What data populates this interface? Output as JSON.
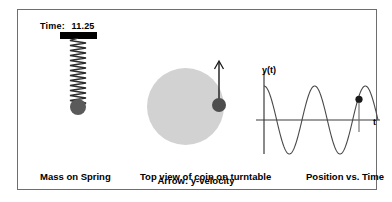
{
  "simulation": {
    "time": {
      "label": "Time:",
      "value": "11.25"
    },
    "spring": {
      "ceiling_name": "spring-support-bar",
      "coil_name": "spring-coil",
      "mass_name": "spring-mass",
      "mass_color": "#5a5a5a",
      "ceiling_color": "#000000"
    },
    "turntable": {
      "disc_color": "#d2d2d2",
      "coin_color": "#4d4d4d",
      "arrow_color": "#000000",
      "arrow_meaning": "y-velocity"
    },
    "graph": {
      "ylabel": "y(t)",
      "xlabel": "t",
      "axis_color": "#3c3c3c",
      "curve_color": "#4a4a4a",
      "marker_color": "#1a1a1a"
    }
  },
  "captions": {
    "spring": "Mass on Spring",
    "turntable": "Top view of coin on turntable",
    "graph": "Position vs. Time",
    "arrow": "Arrow: y-velocity"
  },
  "chart_data": {
    "type": "line",
    "title": "Position vs. Time",
    "xlabel": "t",
    "ylabel": "y(t)",
    "grid": false,
    "legend": "none",
    "xlim": [
      0,
      13.5
    ],
    "ylim": [
      -1.15,
      1.15
    ],
    "series": [
      {
        "name": "y(t)",
        "description": "sinusoidal oscillation, cosine-like, amplitude 1",
        "x": [
          0,
          0.5,
          1,
          1.5,
          2,
          2.5,
          3,
          3.5,
          4,
          4.5,
          5,
          5.5,
          6,
          6.5,
          7,
          7.5,
          8,
          8.5,
          9,
          9.5,
          10,
          10.5,
          11,
          11.25,
          11.5,
          12,
          12.5,
          13
        ],
        "y": [
          1,
          0.87,
          0.5,
          0,
          -0.5,
          -0.87,
          -1,
          -0.87,
          -0.5,
          0,
          0.5,
          0.87,
          1,
          0.87,
          0.5,
          0,
          -0.5,
          -0.87,
          -1,
          -0.87,
          -0.5,
          0,
          0.5,
          0.61,
          0.71,
          0.87,
          1,
          0.87
        ]
      }
    ],
    "markers": [
      {
        "name": "current-position-marker",
        "x": 11.25,
        "y": 0.61,
        "label": ""
      }
    ]
  }
}
